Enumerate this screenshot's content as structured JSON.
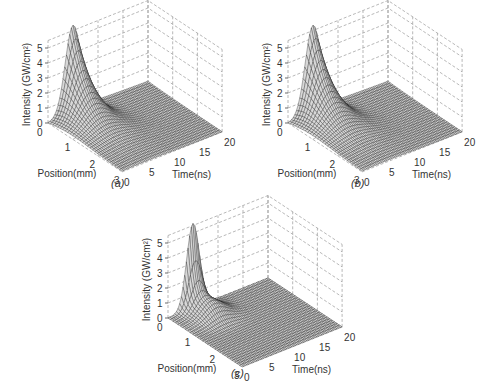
{
  "figure": {
    "panels": [
      {
        "id": "a",
        "caption": "(a)",
        "left": 0,
        "top": 0,
        "caption_x": 111,
        "caption_y": 177
      },
      {
        "id": "b",
        "caption": "(b)",
        "left": 240,
        "top": 0,
        "caption_x": 111,
        "caption_y": 177
      },
      {
        "id": "c",
        "caption": "(c)",
        "left": 120,
        "top": 195,
        "caption_x": 111,
        "caption_y": 172
      }
    ]
  },
  "chart_data": [
    {
      "type": "surface3d",
      "panel": "(a)",
      "title": "",
      "xlabel": "Position(mm)",
      "ylabel": "Time(ns)",
      "zlabel": "Intensity (GW/cm²)",
      "x_ticks": [
        "0",
        "1",
        "2",
        "3"
      ],
      "y_ticks": [
        "0",
        "5",
        "10",
        "15",
        "20"
      ],
      "z_ticks": [
        "0",
        "1",
        "2",
        "3",
        "4",
        "5"
      ],
      "xlim": [
        0,
        3
      ],
      "ylim": [
        0,
        20
      ],
      "zlim": [
        0,
        5
      ],
      "grid": true,
      "description": "Pulse intensity peaks ~5.5 GW/cm² at position 0 mm, time ~5 ns; decays strongly along position and spreads in time (broad tail toward 20 ns).",
      "peak": {
        "position_mm": 0,
        "time_ns": 5,
        "intensity": 5.5
      },
      "model": {
        "kind": "decaying",
        "t0": 5,
        "width0": 2.2,
        "broaden": 1.6,
        "decay": 1.5,
        "amp": 5.5,
        "tail": 0.35
      }
    },
    {
      "type": "surface3d",
      "panel": "(b)",
      "title": "",
      "xlabel": "Position(mm)",
      "ylabel": "Time(ns)",
      "zlabel": "Intensity (GW/cm²)",
      "x_ticks": [
        "0",
        "1",
        "2",
        "3"
      ],
      "y_ticks": [
        "0",
        "5",
        "10",
        "15",
        "20"
      ],
      "z_ticks": [
        "0",
        "1",
        "2",
        "3",
        "4",
        "5"
      ],
      "xlim": [
        0,
        3
      ],
      "ylim": [
        0,
        20
      ],
      "zlim": [
        0,
        5
      ],
      "grid": true,
      "description": "Nearly identical to (a): peak ~5.5 GW/cm² at position 0 mm, time ~5 ns, decaying along position with temporal broadening.",
      "peak": {
        "position_mm": 0,
        "time_ns": 5,
        "intensity": 5.5
      },
      "model": {
        "kind": "decaying",
        "t0": 5,
        "width0": 2.2,
        "broaden": 1.6,
        "decay": 1.45,
        "amp": 5.5,
        "tail": 0.35
      }
    },
    {
      "type": "surface3d",
      "panel": "(c)",
      "title": "",
      "xlabel": "Position(mm)",
      "ylabel": "Time(ns)",
      "zlabel": "Intensity (GW/cm²)",
      "x_ticks": [
        "0",
        "1",
        "2",
        "3"
      ],
      "y_ticks": [
        "0",
        "5",
        "10",
        "15",
        "20"
      ],
      "z_ticks": [
        "0",
        "1",
        "2",
        "3",
        "4",
        "5"
      ],
      "xlim": [
        0,
        3
      ],
      "ylim": [
        0,
        20
      ],
      "zlim": [
        0,
        5
      ],
      "grid": true,
      "description": "Sharp Gaussian pulse ~5.5 GW/cm² at position 0 mm, time ~5 ns, collapsing rapidly with position to a low (~1 GW/cm²) plateau; near-flat surface elsewhere.",
      "peak": {
        "position_mm": 0,
        "time_ns": 5,
        "intensity": 5.5
      },
      "model": {
        "kind": "sharp",
        "t0": 5,
        "width0": 1.8,
        "broaden": 0.6,
        "decay": 6.0,
        "amp": 5.5,
        "tail": 0.9
      }
    }
  ]
}
